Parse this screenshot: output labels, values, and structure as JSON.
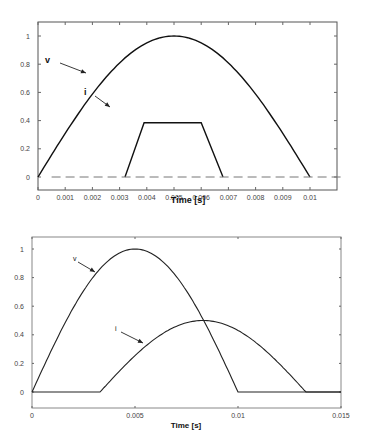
{
  "chart_data": [
    {
      "type": "line",
      "title": "",
      "xlabel": "Time [s]",
      "ylabel": "",
      "xlim": [
        0,
        0.0112
      ],
      "ylim": [
        -0.1,
        1.05
      ],
      "xticks": [
        "0",
        "0.001",
        "0.002",
        "0.003",
        "0.004",
        "0.005",
        "0.006",
        "0.007",
        "0.008",
        "0.009",
        "0.01"
      ],
      "yticks": [
        "0",
        "0.2",
        "0.4",
        "0.6",
        "0.8",
        "1"
      ],
      "grid": false,
      "legend": "none",
      "annotations": [
        {
          "text": "v",
          "points_to_series": "v"
        },
        {
          "text": "i",
          "points_to_series": "i"
        }
      ],
      "series": [
        {
          "name": "v",
          "style": "solid",
          "x": [
            0,
            0.001,
            0.002,
            0.003,
            0.004,
            0.005,
            0.006,
            0.007,
            0.008,
            0.009,
            0.01
          ],
          "y": [
            0,
            0.309,
            0.588,
            0.809,
            0.951,
            1.0,
            0.951,
            0.809,
            0.588,
            0.309,
            0
          ]
        },
        {
          "name": "i",
          "style": "solid",
          "x": [
            0.0032,
            0.0039,
            0.006,
            0.0068
          ],
          "y": [
            0,
            0.385,
            0.385,
            0
          ]
        },
        {
          "name": "zero-reference",
          "style": "dashed",
          "x": [
            0.0005,
            0.0112
          ],
          "y": [
            0,
            0
          ]
        }
      ]
    },
    {
      "type": "line",
      "title": "",
      "xlabel": "Time [s]",
      "ylabel": "",
      "xlim": [
        0,
        0.015
      ],
      "ylim": [
        -0.12,
        1.08
      ],
      "xticks": [
        "0",
        "0.005",
        "0.01",
        "0.015"
      ],
      "yticks": [
        "0",
        "0.2",
        "0.4",
        "0.6",
        "0.8",
        "1"
      ],
      "grid": false,
      "legend": "none",
      "annotations": [
        {
          "text": "v",
          "points_to_series": "v"
        },
        {
          "text": "i",
          "points_to_series": "i"
        }
      ],
      "series": [
        {
          "name": "v",
          "style": "solid",
          "x": [
            0,
            0.001,
            0.002,
            0.003,
            0.004,
            0.005,
            0.006,
            0.007,
            0.008,
            0.009,
            0.01,
            0.015
          ],
          "y": [
            0,
            0.309,
            0.588,
            0.809,
            0.951,
            1.0,
            0.951,
            0.809,
            0.588,
            0.309,
            0,
            0
          ]
        },
        {
          "name": "i",
          "style": "solid",
          "x": [
            0,
            0.0033,
            0.0043,
            0.0053,
            0.0063,
            0.0073,
            0.0083,
            0.0093,
            0.0103,
            0.0113,
            0.0123,
            0.0133
          ],
          "y": [
            0,
            0,
            0.155,
            0.294,
            0.405,
            0.476,
            0.5,
            0.476,
            0.405,
            0.294,
            0.155,
            0
          ]
        }
      ]
    }
  ]
}
